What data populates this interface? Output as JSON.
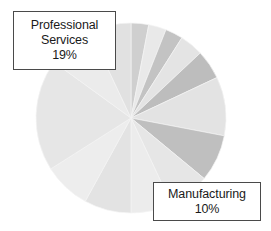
{
  "chart_data": {
    "type": "pie",
    "title": "",
    "legend_position": "none",
    "grid": false,
    "units": "percent",
    "total": 100,
    "start_angle_deg": 0,
    "direction": "clockwise",
    "center": {
      "x": 131,
      "y": 118
    },
    "radius": 95,
    "categories": [
      "Slice 1",
      "Slice 2",
      "Slice 3",
      "Slice 4",
      "Slice 5",
      "Manufacturing",
      "Slice 7",
      "Slice 8",
      "Slice 9",
      "Slice 10",
      "Slice 11",
      "Professional Services",
      "Slice 13",
      "Slice 14"
    ],
    "values": [
      3,
      3,
      3,
      4,
      5,
      10,
      8,
      7,
      7,
      8,
      8,
      19,
      8,
      7
    ],
    "colors": [
      "#cfcfcf",
      "#e9e9e9",
      "#c3c3c3",
      "#e4e4e4",
      "#bdbdbd",
      "#e3e3e3",
      "#bfbfbf",
      "#e6e6e6",
      "#ececec",
      "#e3e3e3",
      "#ededed",
      "#e6e6e6",
      "#ebebeb",
      "#e1e1e1"
    ],
    "labeled_slices": [
      {
        "name": "Professional Services",
        "percent": "19%",
        "index": 11
      },
      {
        "name": "Manufacturing",
        "percent": "10%",
        "index": 5
      }
    ]
  },
  "labels": {
    "professional_services": {
      "line1": "Professional",
      "line2": "Services",
      "line3": "19%"
    },
    "manufacturing": {
      "line1": "Manufacturing",
      "line2": "10%"
    }
  },
  "style": {
    "background": "#ffffff",
    "box_border": "#4a4a4a",
    "box_fill": "#ffffff",
    "text_color": "#1a1a1a"
  }
}
